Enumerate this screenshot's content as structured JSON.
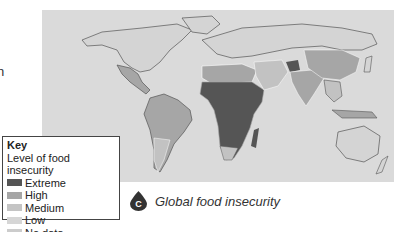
{
  "side_text": "n",
  "map": {
    "background": "#dadada",
    "colors": {
      "extreme": "#555555",
      "high": "#a6a6a6",
      "medium": "#c2c2c2",
      "low": "#d4d4d4",
      "nodata": "#cfcfcf",
      "border": "#ffffff",
      "coast": "#555555"
    }
  },
  "key": {
    "title": "Key",
    "subtitle": "Level of food insecurity",
    "items": [
      {
        "label": "Extreme",
        "color": "#555555"
      },
      {
        "label": "High",
        "color": "#a6a6a6"
      },
      {
        "label": "Medium",
        "color": "#c4c4c4"
      },
      {
        "label": "Low",
        "color": "#d6d6d6"
      },
      {
        "label": "No data",
        "color": "#cccccc"
      }
    ]
  },
  "caption": {
    "badge": "C",
    "text": "Global food insecurity"
  }
}
